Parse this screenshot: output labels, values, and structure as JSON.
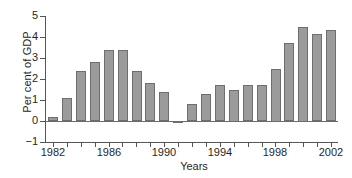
{
  "chart_data": {
    "type": "bar",
    "title": "",
    "subtitle": "",
    "xlabel": "Years",
    "ylabel": "Per cent of GDP",
    "categories": [
      "1982",
      "1983",
      "1984",
      "1985",
      "1986",
      "1987",
      "1988",
      "1989",
      "1990",
      "1991",
      "1992",
      "1993",
      "1994",
      "1995",
      "1996",
      "1997",
      "1998",
      "1999",
      "2000",
      "2001",
      "2002"
    ],
    "values": [
      0.2,
      1.1,
      2.4,
      2.8,
      3.4,
      3.4,
      2.4,
      1.8,
      1.4,
      -0.1,
      0.8,
      1.3,
      1.7,
      1.5,
      1.7,
      1.7,
      2.5,
      3.7,
      4.5,
      4.15,
      4.35
    ],
    "series": [
      {
        "name": "Per cent of GDP",
        "values": [
          0.2,
          1.1,
          2.4,
          2.8,
          3.4,
          3.4,
          2.4,
          1.8,
          1.4,
          -0.1,
          0.8,
          1.3,
          1.7,
          1.5,
          1.7,
          1.7,
          2.5,
          3.7,
          4.5,
          4.15,
          4.35
        ]
      }
    ],
    "ylim": [
      -1,
      5
    ],
    "xlim": [
      1981.5,
      2002.5
    ],
    "ytick_labels": [
      "5",
      "4",
      "3",
      "2",
      "1",
      "0",
      "-1"
    ],
    "ytick_values": [
      5,
      4,
      3,
      2,
      1,
      0,
      -1
    ],
    "xtick_labels": [
      "1982",
      "1986",
      "1990",
      "1994",
      "1998",
      "2002"
    ],
    "xtick_values": [
      1982,
      1986,
      1990,
      1994,
      1998,
      2002
    ],
    "grid": false,
    "legend": false,
    "legend_position": "none",
    "bar_color": "#9b9b9b",
    "bar_edge_color": "#6e6e6e",
    "axis_color": "#555555",
    "background_color": "#ffffff"
  }
}
